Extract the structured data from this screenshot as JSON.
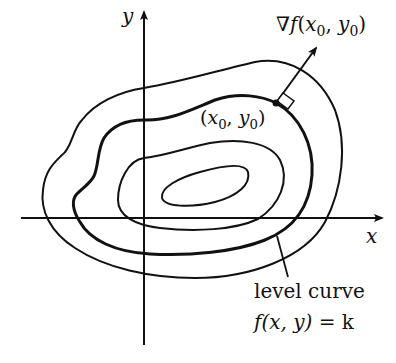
{
  "diagram": {
    "axes": {
      "x_label": "x",
      "y_label": "y"
    },
    "labels": {
      "gradient": {
        "nabla": "∇",
        "f": "f",
        "open": "(",
        "x": "x",
        "x_sub": "0",
        "comma": ", ",
        "y": "y",
        "y_sub": "0",
        "close": ")"
      },
      "point": {
        "open": "(",
        "x": "x",
        "x_sub": "0",
        "comma": ", ",
        "y": "y",
        "y_sub": "0",
        "close": ")"
      },
      "level_curve_caption": "level curve",
      "level_curve_equation": {
        "f": "f",
        "args": "(x, y)",
        "equals": " = k"
      }
    },
    "colors": {
      "stroke": "#111111",
      "background": "#ffffff"
    },
    "contours": [
      {
        "name": "outer-contour",
        "bold": false
      },
      {
        "name": "level-curve",
        "bold": true
      },
      {
        "name": "inner-contour",
        "bold": false
      },
      {
        "name": "innermost-contour",
        "bold": false
      }
    ]
  }
}
